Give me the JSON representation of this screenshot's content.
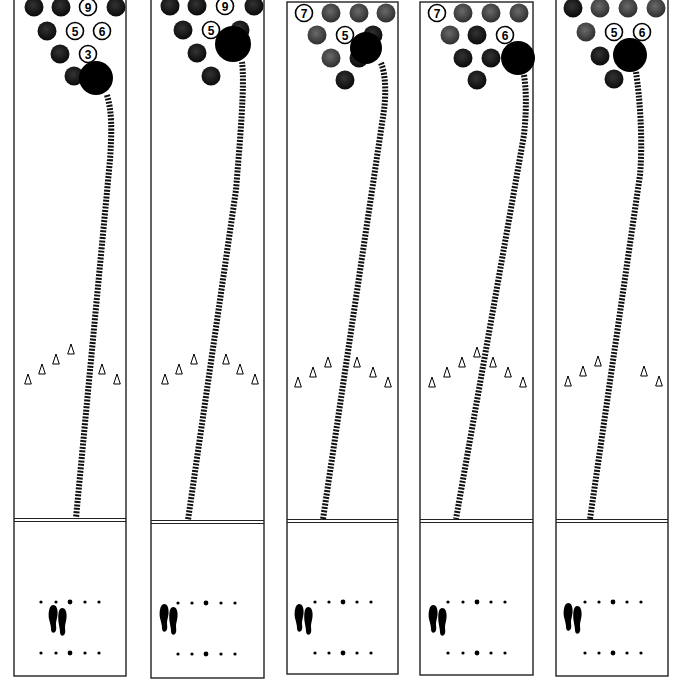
{
  "figure": {
    "title": "",
    "colors": {
      "line": "#222222",
      "ball": "#000000",
      "knocked_pin": "#1c1c1c",
      "gray_pin": "#4a4a4a",
      "standing_pin_fill": "#ffffff",
      "path": "#111111"
    }
  },
  "lanes": [
    {
      "id": 1,
      "x": 14,
      "top": -6,
      "width": 112,
      "bottom": 676,
      "foul_y": 520,
      "pins": [
        {
          "cx": 34,
          "cy": 7,
          "type": "dark"
        },
        {
          "cx": 61,
          "cy": 7,
          "type": "dark"
        },
        {
          "cx": 88,
          "cy": 7,
          "type": "standing",
          "label": "9"
        },
        {
          "cx": 116,
          "cy": 7,
          "type": "dark"
        },
        {
          "cx": 47,
          "cy": 31,
          "type": "dark"
        },
        {
          "cx": 75,
          "cy": 31,
          "type": "standing",
          "label": "5"
        },
        {
          "cx": 102,
          "cy": 31,
          "type": "standing",
          "label": "6"
        },
        {
          "cx": 60,
          "cy": 54,
          "type": "dark"
        },
        {
          "cx": 88,
          "cy": 54,
          "type": "standing",
          "label": "3"
        },
        {
          "cx": 74,
          "cy": 76,
          "type": "dark"
        }
      ],
      "ball": {
        "cx": 96,
        "cy": 78,
        "r": 17
      },
      "path": "M 107 95 C 112 112, 112 130, 110 160 L 76 518",
      "arrows": [
        28,
        42,
        56,
        71,
        102,
        117
      ],
      "arrow_y": [
        380,
        370,
        360,
        350,
        370,
        380
      ],
      "dots_x": [
        41,
        56,
        70,
        85,
        99
      ],
      "foot": {
        "x": 48,
        "y": 605
      }
    },
    {
      "id": 2,
      "x": 151,
      "top": -6,
      "width": 113,
      "bottom": 678,
      "foul_y": 522,
      "pins": [
        {
          "cx": 170,
          "cy": 6,
          "type": "dark"
        },
        {
          "cx": 197,
          "cy": 6,
          "type": "dark"
        },
        {
          "cx": 225,
          "cy": 6,
          "type": "standing",
          "label": "9"
        },
        {
          "cx": 254,
          "cy": 6,
          "type": "dark"
        },
        {
          "cx": 183,
          "cy": 30,
          "type": "dark"
        },
        {
          "cx": 211,
          "cy": 30,
          "type": "standing",
          "label": "5"
        },
        {
          "cx": 240,
          "cy": 30,
          "type": "dark"
        },
        {
          "cx": 197,
          "cy": 53,
          "type": "dark"
        },
        {
          "cx": 211,
          "cy": 76,
          "type": "dark"
        }
      ],
      "ball": {
        "cx": 233,
        "cy": 44,
        "r": 18
      },
      "path": "M 242 62 C 245 85, 240 140, 236 190 L 188 520",
      "arrows": [
        165,
        179,
        194,
        226,
        240,
        255
      ],
      "arrow_y": [
        380,
        370,
        360,
        360,
        370,
        380
      ],
      "dots_x": [
        178,
        192,
        206,
        221,
        235
      ],
      "foot": {
        "x": 159,
        "y": 604
      }
    },
    {
      "id": 3,
      "x": 287,
      "top": 2,
      "width": 111,
      "bottom": 674,
      "foul_y": 521,
      "pins": [
        {
          "cx": 304,
          "cy": 13,
          "type": "standing",
          "label": "7"
        },
        {
          "cx": 331,
          "cy": 13,
          "type": "gray"
        },
        {
          "cx": 359,
          "cy": 13,
          "type": "gray"
        },
        {
          "cx": 386,
          "cy": 13,
          "type": "gray"
        },
        {
          "cx": 317,
          "cy": 35,
          "type": "gray"
        },
        {
          "cx": 345,
          "cy": 35,
          "type": "standing",
          "label": "5"
        },
        {
          "cx": 373,
          "cy": 35,
          "type": "dark"
        },
        {
          "cx": 331,
          "cy": 58,
          "type": "gray"
        },
        {
          "cx": 359,
          "cy": 58,
          "type": "dark"
        },
        {
          "cx": 345,
          "cy": 80,
          "type": "dark"
        }
      ],
      "ball": {
        "cx": 366,
        "cy": 48,
        "r": 16
      },
      "path": "M 381 63 C 386 75, 386 95, 384 110 L 323 519",
      "arrows": [
        298,
        313,
        328,
        357,
        373,
        388
      ],
      "arrow_y": [
        383,
        373,
        363,
        363,
        373,
        383
      ],
      "dots_x": [
        315,
        329,
        343,
        357,
        371
      ],
      "foot": {
        "x": 294,
        "y": 604
      }
    },
    {
      "id": 4,
      "x": 420,
      "top": 2,
      "width": 113,
      "bottom": 675,
      "foul_y": 521,
      "pins": [
        {
          "cx": 437,
          "cy": 13,
          "type": "standing",
          "label": "7"
        },
        {
          "cx": 463,
          "cy": 13,
          "type": "gray"
        },
        {
          "cx": 491,
          "cy": 13,
          "type": "gray"
        },
        {
          "cx": 519,
          "cy": 13,
          "type": "gray"
        },
        {
          "cx": 450,
          "cy": 35,
          "type": "gray"
        },
        {
          "cx": 477,
          "cy": 35,
          "type": "dark"
        },
        {
          "cx": 505,
          "cy": 35,
          "type": "standing",
          "label": "6"
        },
        {
          "cx": 463,
          "cy": 58,
          "type": "dark"
        },
        {
          "cx": 491,
          "cy": 58,
          "type": "dark"
        },
        {
          "cx": 477,
          "cy": 80,
          "type": "dark"
        }
      ],
      "ball": {
        "cx": 518,
        "cy": 58,
        "r": 17
      },
      "path": "M 524 75 C 527 95, 526 115, 524 135 L 456 519",
      "arrows": [
        432,
        447,
        462,
        477,
        493,
        508,
        523
      ],
      "arrow_y": [
        383,
        373,
        363,
        353,
        363,
        373,
        383
      ],
      "dots_x": [
        448,
        463,
        477,
        491,
        505
      ],
      "foot": {
        "x": 428,
        "y": 605
      }
    },
    {
      "id": 5,
      "x": 556,
      "top": -6,
      "width": 112,
      "bottom": 676,
      "foul_y": 521,
      "pins": [
        {
          "cx": 573,
          "cy": 8,
          "type": "dark"
        },
        {
          "cx": 600,
          "cy": 8,
          "type": "gray"
        },
        {
          "cx": 628,
          "cy": 8,
          "type": "gray"
        },
        {
          "cx": 656,
          "cy": 8,
          "type": "gray"
        },
        {
          "cx": 586,
          "cy": 32,
          "type": "gray"
        },
        {
          "cx": 614,
          "cy": 32,
          "type": "standing",
          "label": "5"
        },
        {
          "cx": 642,
          "cy": 32,
          "type": "standing",
          "label": "6"
        },
        {
          "cx": 600,
          "cy": 56,
          "type": "dark"
        },
        {
          "cx": 614,
          "cy": 79,
          "type": "dark"
        }
      ],
      "ball": {
        "cx": 630,
        "cy": 55,
        "r": 17
      },
      "path": "M 636 72 C 640 100, 643 140, 640 175 L 590 519",
      "arrows": [
        568,
        583,
        598,
        644,
        659
      ],
      "arrow_y": [
        382,
        372,
        362,
        372,
        382
      ],
      "dots_x": [
        585,
        599,
        613,
        627,
        641
      ],
      "foot": {
        "x": 563,
        "y": 603
      }
    }
  ]
}
